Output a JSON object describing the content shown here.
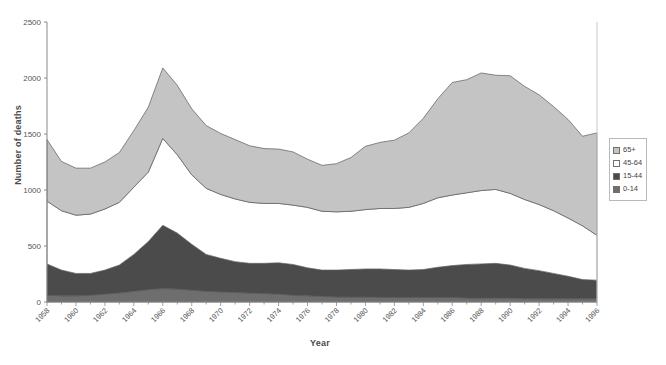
{
  "chart_data": {
    "type": "area",
    "stacked": true,
    "title": "",
    "xlabel": "Year",
    "ylabel": "Number of deaths",
    "ylim": [
      0,
      2500
    ],
    "yticks": [
      0,
      500,
      1000,
      1500,
      2000,
      2500
    ],
    "xlim": [
      1958,
      1996
    ],
    "grid": false,
    "legend_position": "right",
    "x": [
      1958,
      1959,
      1960,
      1961,
      1962,
      1963,
      1964,
      1965,
      1966,
      1967,
      1968,
      1969,
      1970,
      1971,
      1972,
      1973,
      1974,
      1975,
      1976,
      1977,
      1978,
      1979,
      1980,
      1981,
      1982,
      1983,
      1984,
      1985,
      1986,
      1987,
      1988,
      1989,
      1990,
      1991,
      1992,
      1993,
      1994,
      1995,
      1996
    ],
    "xtick_labels": [
      "1958",
      "1960",
      "1962",
      "1964",
      "1966",
      "1968",
      "1970",
      "1972",
      "1974",
      "1976",
      "1978",
      "1980",
      "1982",
      "1984",
      "1986",
      "1988",
      "1990",
      "1992",
      "1994",
      "1996"
    ],
    "series": [
      {
        "name": "0-14",
        "color": "#6e6e6e",
        "values": [
          60,
          55,
          55,
          60,
          70,
          80,
          95,
          110,
          120,
          115,
          105,
          95,
          90,
          85,
          80,
          75,
          70,
          60,
          55,
          50,
          45,
          45,
          45,
          40,
          40,
          40,
          40,
          40,
          40,
          35,
          35,
          35,
          35,
          30,
          30,
          30,
          30,
          30,
          30
        ]
      },
      {
        "name": "15-44",
        "color": "#4b4b4b",
        "values": [
          280,
          230,
          200,
          195,
          215,
          250,
          330,
          430,
          565,
          500,
          410,
          330,
          300,
          275,
          265,
          270,
          280,
          275,
          250,
          235,
          240,
          245,
          250,
          255,
          250,
          245,
          250,
          270,
          285,
          300,
          305,
          310,
          295,
          270,
          250,
          225,
          200,
          170,
          165
        ]
      },
      {
        "name": "45-64",
        "color": "#ffffff",
        "values": [
          560,
          530,
          520,
          530,
          545,
          560,
          600,
          620,
          775,
          700,
          620,
          590,
          570,
          560,
          545,
          535,
          530,
          530,
          540,
          525,
          520,
          520,
          530,
          540,
          545,
          560,
          590,
          620,
          630,
          640,
          655,
          660,
          640,
          615,
          590,
          560,
          520,
          480,
          400
        ]
      },
      {
        "name": "65+",
        "color": "#c4c4c4",
        "values": [
          550,
          440,
          420,
          410,
          420,
          445,
          505,
          580,
          630,
          620,
          590,
          560,
          545,
          530,
          505,
          490,
          485,
          475,
          430,
          410,
          430,
          480,
          565,
          590,
          610,
          665,
          760,
          885,
          1005,
          1010,
          1050,
          1020,
          1050,
          1010,
          980,
          930,
          880,
          800,
          915
        ]
      }
    ],
    "totals_note": "Stacked totals peak ~2090 in 1966 and ~2030 in 1988; trough ~1050 in 1976."
  },
  "legend": {
    "items": [
      {
        "label": "65+",
        "color": "#c4c4c4"
      },
      {
        "label": "45-64",
        "color": "#ffffff"
      },
      {
        "label": "15-44",
        "color": "#4b4b4b"
      },
      {
        "label": "0-14",
        "color": "#6e6e6e"
      }
    ]
  }
}
